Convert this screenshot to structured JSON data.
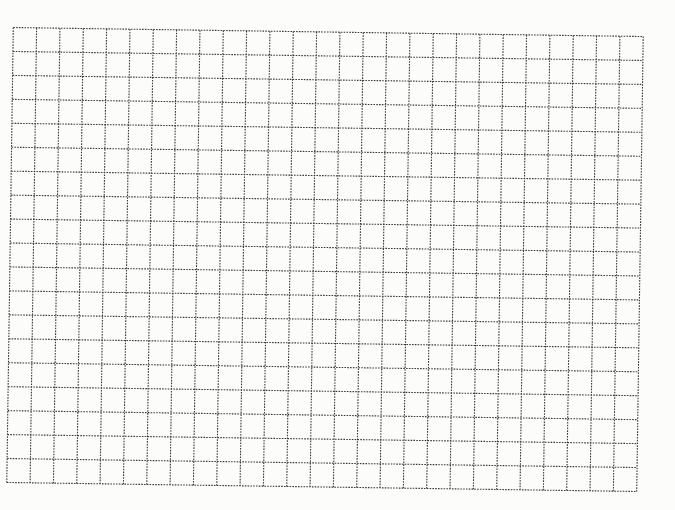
{
  "grid": {
    "columns": 27,
    "rows": 19,
    "width_px": 630,
    "height_px": 455,
    "rotation_deg": 0.82,
    "line_style": "dotted",
    "colors": {
      "background": "#fcfcfb",
      "line": "#3a3a3a"
    }
  }
}
